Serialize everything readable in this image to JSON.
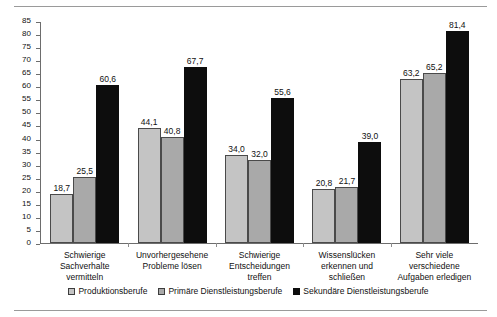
{
  "chart_data": {
    "type": "bar",
    "title": "",
    "subtitle": "",
    "xlabel": "",
    "ylabel": "",
    "ylim": [
      0,
      85
    ],
    "ytick_step": 5,
    "grid": false,
    "legend_position": "bottom",
    "value_labels": true,
    "decimal_separator": ",",
    "yticks": [
      "85",
      "80",
      "75",
      "70",
      "65",
      "60",
      "55",
      "50",
      "45",
      "40",
      "35",
      "30",
      "25",
      "20",
      "15",
      "10",
      "5",
      "0"
    ],
    "categories": [
      "Schwierige Sachverhalte vermitteln",
      "Unvorhergesehene Probleme lösen",
      "Schwierige Entscheidungen treffen",
      "Wissenslücken erkennen und schließen",
      "Sehr viele verschiedene Aufgaben erledigen"
    ],
    "category_lines": [
      [
        "Schwierige",
        "Sachverhalte",
        "vermitteln"
      ],
      [
        "Unvorhergesehene",
        "Probleme lösen"
      ],
      [
        "Schwierige",
        "Entscheidungen",
        "treffen"
      ],
      [
        "Wissenslücken",
        "erkennen und",
        "schließen"
      ],
      [
        "Sehr viele",
        "verschiedene",
        "Aufgaben erledigen"
      ]
    ],
    "series": [
      {
        "name": "Produktionsberufe",
        "color": "#c4c4c4",
        "values": [
          18.7,
          44.1,
          34.0,
          20.8,
          63.2
        ],
        "labels": [
          "18,7",
          "44,1",
          "34,0",
          "20,8",
          "63,2"
        ]
      },
      {
        "name": "Primäre Dienstleistungsberufe",
        "color": "#a9a9a9",
        "values": [
          25.5,
          40.8,
          32.0,
          21.7,
          65.2
        ],
        "labels": [
          "25,5",
          "40,8",
          "32,0",
          "21,7",
          "65,2"
        ]
      },
      {
        "name": "Sekundäre Dienstleistungsberufe",
        "color": "#0d0d0d",
        "values": [
          60.6,
          67.7,
          55.6,
          39.0,
          81.4
        ],
        "labels": [
          "60,6",
          "67,7",
          "55,6",
          "39,0",
          "81,4"
        ]
      }
    ]
  }
}
